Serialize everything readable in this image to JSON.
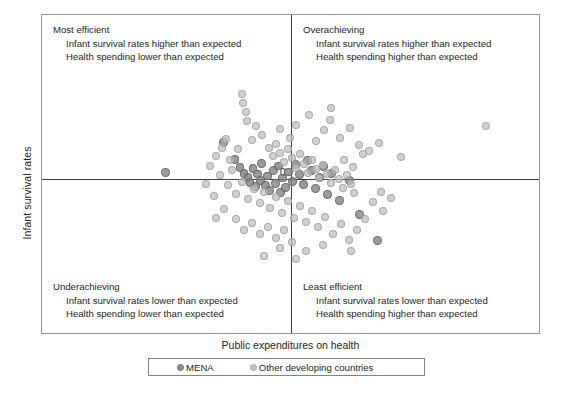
{
  "chart_data": {
    "type": "scatter",
    "title": "",
    "xlabel": "Public expenditures on health",
    "ylabel": "Infant survival rates",
    "origin_label": "0",
    "xlim": [
      -1.0,
      1.0
    ],
    "ylim": [
      -1.0,
      1.0
    ],
    "grid": false,
    "axes_style": "crosshair-at-origin",
    "legend_position": "bottom",
    "legend": [
      {
        "name": "MENA",
        "color": "#8d8d8f"
      },
      {
        "name": "Other developing countries",
        "color": "#c2c2c4"
      }
    ],
    "quadrant_annotations": [
      {
        "id": "top-left",
        "title": "Most efficient",
        "lines": [
          "Infant survival rates higher than expected",
          "Health spending lower than expected"
        ]
      },
      {
        "id": "top-right",
        "title": "Overachieving",
        "lines": [
          "Infant survival rates higher than expected",
          "Health spending higher than expected"
        ]
      },
      {
        "id": "bottom-left",
        "title": "Underachieving",
        "lines": [
          "Infant survival rates lower than expected",
          "Health spending lower than expected"
        ]
      },
      {
        "id": "bottom-right",
        "title": "Least efficient",
        "lines": [
          "Infant survival rates lower than expected",
          "Health spending higher than expected"
        ]
      }
    ],
    "series": [
      {
        "name": "MENA",
        "color": "#8d8d8f",
        "points": [
          [
            -0.504,
            0.042
          ],
          [
            -0.271,
            0.222
          ],
          [
            -0.225,
            0.118
          ],
          [
            -0.205,
            0.071
          ],
          [
            -0.189,
            0.035
          ],
          [
            -0.173,
            0.01
          ],
          [
            -0.165,
            -0.022
          ],
          [
            -0.153,
            0.062
          ],
          [
            -0.141,
            -0.05
          ],
          [
            -0.133,
            0.031
          ],
          [
            -0.121,
            -0.008
          ],
          [
            -0.117,
            0.096
          ],
          [
            -0.101,
            -0.041
          ],
          [
            -0.093,
            0.018
          ],
          [
            -0.085,
            -0.073
          ],
          [
            -0.069,
            0.054
          ],
          [
            -0.061,
            -0.027
          ],
          [
            -0.049,
            0.079
          ],
          [
            -0.041,
            -0.09
          ],
          [
            -0.033,
            0.006
          ],
          [
            -0.021,
            -0.055
          ],
          [
            -0.009,
            0.043
          ],
          [
            0.006,
            -0.015
          ],
          [
            0.018,
            0.088
          ],
          [
            0.034,
            0.027
          ],
          [
            0.051,
            -0.037
          ],
          [
            0.066,
            0.113
          ],
          [
            0.082,
            0.05
          ],
          [
            0.098,
            -0.064
          ],
          [
            0.115,
            0.008
          ],
          [
            0.131,
            0.074
          ],
          [
            0.147,
            -0.101
          ],
          [
            0.163,
            0.035
          ],
          [
            0.196,
            -0.14
          ],
          [
            0.236,
            -0.009
          ],
          [
            0.276,
            -0.232
          ],
          [
            0.349,
            -0.398
          ]
        ]
      },
      {
        "name": "Other developing countries",
        "color": "#c2c2c4",
        "points": [
          [
            -0.196,
            0.521
          ],
          [
            -0.192,
            0.462
          ],
          [
            -0.18,
            0.41
          ],
          [
            -0.176,
            0.354
          ],
          [
            -0.26,
            0.244
          ],
          [
            -0.155,
            0.238
          ],
          [
            -0.115,
            0.266
          ],
          [
            -0.09,
            0.19
          ],
          [
            -0.074,
            0.142
          ],
          [
            -0.059,
            0.214
          ],
          [
            -0.043,
            0.158
          ],
          [
            -0.027,
            0.102
          ],
          [
            -0.011,
            0.182
          ],
          [
            0.004,
            0.126
          ],
          [
            0.02,
            0.07
          ],
          [
            0.035,
            0.15
          ],
          [
            0.051,
            0.094
          ],
          [
            0.067,
            0.038
          ],
          [
            0.083,
            0.118
          ],
          [
            0.099,
            0.062
          ],
          [
            0.114,
            0.006
          ],
          [
            0.13,
            0.086
          ],
          [
            0.146,
            0.03
          ],
          [
            0.162,
            -0.026
          ],
          [
            0.177,
            0.054
          ],
          [
            0.193,
            -0.002
          ],
          [
            0.209,
            -0.058
          ],
          [
            0.225,
            0.022
          ],
          [
            0.24,
            -0.034
          ],
          [
            0.256,
            -0.09
          ],
          [
            0.02,
            0.33
          ],
          [
            0.072,
            0.388
          ],
          [
            0.132,
            0.298
          ],
          [
            0.156,
            0.36
          ],
          [
            0.196,
            0.252
          ],
          [
            0.236,
            0.314
          ],
          [
            0.276,
            0.206
          ],
          [
            0.316,
            0.17
          ],
          [
            0.356,
            0.222
          ],
          [
            0.445,
            0.136
          ],
          [
            0.788,
            0.322
          ],
          [
            -0.325,
            0.078
          ],
          [
            -0.301,
            0.138
          ],
          [
            -0.285,
            0.022
          ],
          [
            -0.253,
            -0.042
          ],
          [
            -0.237,
            0.054
          ],
          [
            -0.221,
            -0.098
          ],
          [
            -0.197,
            -0.018
          ],
          [
            -0.173,
            -0.13
          ],
          [
            -0.149,
            -0.062
          ],
          [
            -0.125,
            -0.154
          ],
          [
            -0.109,
            -0.086
          ],
          [
            -0.085,
            -0.186
          ],
          [
            -0.061,
            -0.114
          ],
          [
            -0.037,
            -0.218
          ],
          [
            -0.013,
            -0.146
          ],
          [
            0.011,
            -0.25
          ],
          [
            0.035,
            -0.178
          ],
          [
            0.059,
            -0.282
          ],
          [
            0.083,
            -0.21
          ],
          [
            -0.221,
            -0.262
          ],
          [
            -0.189,
            -0.33
          ],
          [
            -0.157,
            -0.286
          ],
          [
            -0.125,
            -0.358
          ],
          [
            -0.093,
            -0.31
          ],
          [
            -0.061,
            -0.386
          ],
          [
            -0.029,
            -0.334
          ],
          [
            0.003,
            -0.41
          ],
          [
            -0.269,
            -0.198
          ],
          [
            -0.301,
            -0.254
          ],
          [
            0.107,
            -0.31
          ],
          [
            0.139,
            -0.246
          ],
          [
            0.171,
            -0.354
          ],
          [
            0.203,
            -0.29
          ],
          [
            0.235,
            -0.398
          ],
          [
            0.267,
            -0.33
          ],
          [
            0.131,
            -0.43
          ],
          [
            0.059,
            -0.466
          ],
          [
            -0.045,
            -0.45
          ],
          [
            0.299,
            -0.262
          ],
          [
            0.019,
            -0.518
          ],
          [
            -0.109,
            -0.498
          ],
          [
            0.243,
            -0.47
          ],
          [
            0.371,
            -0.206
          ],
          [
            -0.005,
            0.25
          ],
          [
            -0.045,
            0.306
          ],
          [
            0.1,
            0.23
          ],
          [
            -0.14,
            0.326
          ],
          [
            0.16,
            0.43
          ],
          [
            0.212,
            0.118
          ],
          [
            0.252,
            0.074
          ],
          [
            0.292,
            0.15
          ],
          [
            -0.213,
            0.182
          ],
          [
            -0.245,
            0.118
          ],
          [
            -0.277,
            0.19
          ],
          [
            -0.309,
            -0.11
          ],
          [
            -0.341,
            -0.03
          ],
          [
            0.332,
            -0.15
          ],
          [
            0.364,
            -0.086
          ],
          [
            0.404,
            -0.122
          ]
        ]
      }
    ]
  }
}
